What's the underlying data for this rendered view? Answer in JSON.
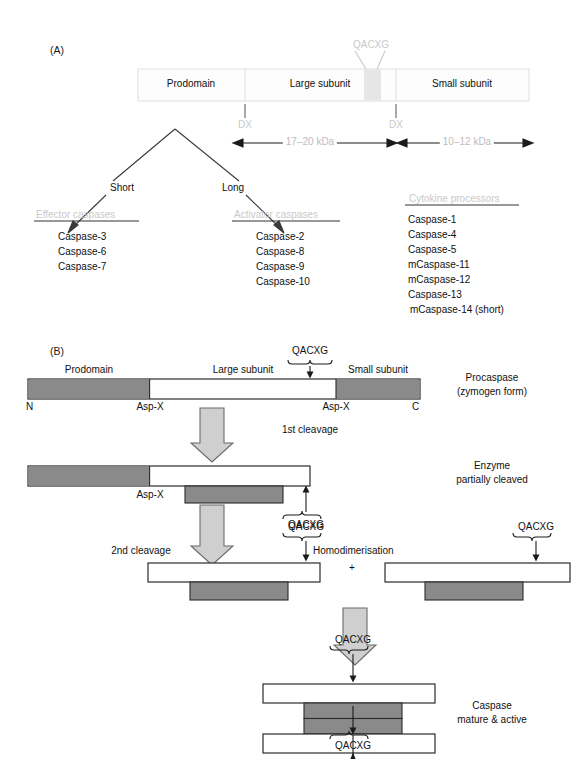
{
  "figure": {
    "panel_a_tag": "(A)",
    "panel_b_tag": "(B)"
  },
  "panel_a": {
    "procaspase_bar": {
      "segments": [
        {
          "name": "prodomain",
          "label": "Prodomain"
        },
        {
          "name": "large-subunit",
          "label": "Large subunit"
        },
        {
          "name": "small-subunit",
          "label": "Small subunit"
        }
      ],
      "motif_label": "QACXG",
      "cleavage_site_left": "DX",
      "cleavage_site_right": "DX",
      "size_large": "17–20 kDa",
      "size_small": "10–12 kDa"
    },
    "branches": {
      "short_label": "Short",
      "long_label": "Long"
    },
    "groups": [
      {
        "name": "effector-caspases",
        "heading": "Effector caspases",
        "members": [
          "Caspase-3",
          "Caspase-6",
          "Caspase-7"
        ]
      },
      {
        "name": "activator-caspases",
        "heading": "Activator caspases",
        "members": [
          "Caspase-2",
          "Caspase-8",
          "Caspase-9",
          "Caspase-10"
        ]
      },
      {
        "name": "cytokine-processors",
        "heading": "Cytokine processors",
        "members": [
          "Caspase-1",
          "Caspase-4",
          "Caspase-5",
          "mCaspase-11",
          "mCaspase-12",
          "Caspase-13",
          "mCaspase-14 (short)"
        ]
      }
    ]
  },
  "panel_b": {
    "stage1": {
      "segment_prodomain": "Prodomain",
      "segment_large": "Large subunit",
      "segment_small": "Small subunit",
      "motif": "QACXG",
      "terminus_n": "N",
      "terminus_c": "C",
      "cleavage_left": "Asp-X",
      "cleavage_right": "Asp-X",
      "caption_line1": "Procaspase",
      "caption_line2": "(zymogen form)"
    },
    "step1_label": "1st cleavage",
    "stage2": {
      "cleavage_left": "Asp-X",
      "motif": "QACXG",
      "caption_line1": "Enzyme",
      "caption_line2": "partially cleaved"
    },
    "step2_label": "2nd cleavage",
    "stage3": {
      "motif_left": "QACXG",
      "motif_right": "QACXG",
      "dimerisation_label": "Homodimerisation",
      "plus": "+"
    },
    "stage4": {
      "motif_top": "QACXG",
      "motif_bottom": "QACXG",
      "caption_line1": "Caspase",
      "caption_line2": "mature & active"
    }
  },
  "colors": {
    "subunit_gray": "#8a8a8a",
    "arrow_gray": "#cccccc",
    "faint_text": "#c9c9c9",
    "outline": "#333333",
    "panel_a_bar_fill": "#fdfdfd",
    "panel_a_bar_stroke": "#e2e2e2",
    "qacxg_band": "#e6e6e6"
  }
}
